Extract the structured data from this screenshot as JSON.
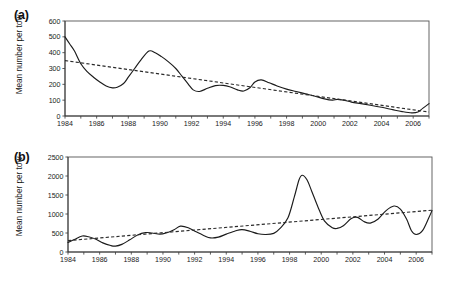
{
  "figure": {
    "panels": [
      {
        "key": "a",
        "label": "(a)",
        "ylabel": "Mean number per tow",
        "yticks": [
          "0",
          "100",
          "200",
          "300",
          "400",
          "500",
          "600"
        ],
        "xticks": [
          "1984",
          "1986",
          "1988",
          "1990",
          "1992",
          "1994",
          "1996",
          "1998",
          "2000",
          "2002",
          "2004",
          "2006"
        ]
      },
      {
        "key": "b",
        "label": "(b)",
        "ylabel": "Mean number per tow",
        "yticks": [
          "0",
          "500",
          "1000",
          "1500",
          "2000",
          "2500"
        ],
        "xticks": [
          "1984",
          "1986",
          "1988",
          "1990",
          "1992",
          "1994",
          "1996",
          "1998",
          "2000",
          "2002",
          "2004",
          "2006"
        ]
      }
    ]
  },
  "chart_data": [
    {
      "type": "line",
      "panel": "(a)",
      "title": "",
      "xlabel": "",
      "ylabel": "Mean number per tow",
      "xlim": [
        1984,
        2007
      ],
      "ylim": [
        0,
        600
      ],
      "ytick_step": 100,
      "xtick_step": 2,
      "grid": false,
      "legend": "none",
      "series": [
        {
          "name": "Mean number per tow (annual smoothed series)",
          "style": "solid",
          "x": [
            1984.0,
            1984.3,
            1984.6,
            1985.0,
            1985.4,
            1985.8,
            1986.2,
            1986.6,
            1987.0,
            1987.3,
            1987.7,
            1988.0,
            1988.4,
            1988.8,
            1989.3,
            1989.7,
            1990.1,
            1990.5,
            1991.0,
            1991.4,
            1991.8,
            1992.1,
            1992.5,
            1993.0,
            1993.5,
            1994.0,
            1994.4,
            1994.9,
            1995.3,
            1995.7,
            1996.0,
            1996.4,
            1996.9,
            1997.4,
            1998.0,
            1998.6,
            1999.2,
            1999.8,
            2000.4,
            2000.9,
            2001.2,
            2001.6,
            2002.1,
            2002.7,
            2003.3,
            2004.0,
            2004.7,
            2005.3,
            2005.9,
            2006.3,
            2006.6,
            2007.0
          ],
          "y": [
            500,
            455,
            410,
            330,
            280,
            245,
            215,
            190,
            178,
            182,
            205,
            245,
            300,
            355,
            410,
            400,
            375,
            345,
            300,
            250,
            200,
            165,
            155,
            175,
            192,
            193,
            185,
            165,
            158,
            180,
            215,
            228,
            210,
            190,
            170,
            155,
            140,
            125,
            108,
            100,
            105,
            100,
            88,
            78,
            68,
            55,
            40,
            28,
            20,
            25,
            48,
            78
          ]
        },
        {
          "name": "Linear trend",
          "style": "dashed",
          "x": [
            1984,
            2007
          ],
          "y": [
            350,
            25
          ]
        }
      ]
    },
    {
      "type": "line",
      "panel": "(b)",
      "title": "",
      "xlabel": "",
      "ylabel": "Mean number per tow",
      "xlim": [
        1984,
        2007
      ],
      "ylim": [
        0,
        2500
      ],
      "ytick_step": 500,
      "xtick_step": 2,
      "grid": false,
      "legend": "none",
      "series": [
        {
          "name": "Mean number per tow (annual smoothed series)",
          "style": "solid",
          "x": [
            1984.0,
            1984.4,
            1984.9,
            1985.3,
            1985.8,
            1986.2,
            1986.7,
            1987.0,
            1987.4,
            1987.9,
            1988.4,
            1988.9,
            1989.3,
            1989.8,
            1990.2,
            1990.7,
            1991.1,
            1991.6,
            1992.1,
            1992.6,
            1993.0,
            1993.5,
            1994.0,
            1994.6,
            1995.0,
            1995.5,
            1996.0,
            1996.5,
            1997.0,
            1997.4,
            1997.9,
            1998.3,
            1998.6,
            1998.8,
            1999.1,
            1999.4,
            1999.8,
            2000.2,
            2000.7,
            2001.0,
            2001.4,
            2001.9,
            2002.3,
            2002.7,
            2003.1,
            2003.6,
            2004.1,
            2004.6,
            2005.0,
            2005.4,
            2005.7,
            2006.0,
            2006.4,
            2006.8,
            2007.0
          ],
          "y": [
            250,
            330,
            420,
            400,
            330,
            240,
            170,
            155,
            200,
            320,
            450,
            510,
            500,
            470,
            500,
            585,
            680,
            640,
            530,
            430,
            370,
            390,
            470,
            560,
            590,
            545,
            480,
            460,
            490,
            620,
            900,
            1450,
            1900,
            2020,
            1900,
            1600,
            1180,
            820,
            640,
            620,
            690,
            880,
            910,
            800,
            760,
            870,
            1090,
            1210,
            1130,
            860,
            560,
            460,
            560,
            900,
            1090
          ]
        },
        {
          "name": "Linear trend",
          "style": "dashed",
          "x": [
            1984,
            2007
          ],
          "y": [
            300,
            1100
          ]
        }
      ]
    }
  ]
}
